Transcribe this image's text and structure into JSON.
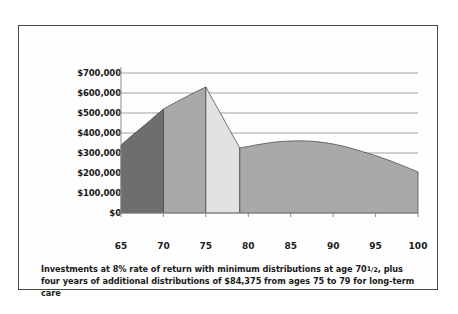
{
  "caption": {
    "line1_a": "Investments at 8% rate of return with minimum distributions at age 70",
    "line1_frac_n": "1",
    "line1_frac_slash": "/",
    "line1_frac_d": "2",
    "line1_b": ", plus four",
    "line2": "years of additional distributions of $84,375 from ages 75 to 79 for long-term care"
  },
  "colors": {
    "band_1": "#6e6e6e",
    "band_2": "#a9a9a9",
    "band_3": "#e2e2e2",
    "band_4": "#a9a9a9",
    "gridline": "#8a8a8a",
    "axis": "#8a8a8a",
    "outline": "#3c3c3c",
    "frame": "#4a4a4a",
    "text": "#1a1a1a",
    "background": "#ffffff"
  },
  "chart_data": {
    "type": "area",
    "title": "",
    "subtitle": "",
    "xlabel": "",
    "ylabel": "",
    "xlim": [
      65,
      100
    ],
    "ylim": [
      0,
      700000
    ],
    "grid": true,
    "legend_position": "none",
    "x_ticks": [
      65,
      70,
      75,
      80,
      85,
      90,
      95,
      100
    ],
    "x_tick_labels": [
      "65",
      "70",
      "75",
      "80",
      "85",
      "90",
      "95",
      "100"
    ],
    "y_ticks": [
      0,
      100000,
      200000,
      300000,
      400000,
      500000,
      600000,
      700000
    ],
    "y_tick_labels": [
      "$0",
      "$100,000",
      "$200,000",
      "$300,000",
      "$400,000",
      "$500,000",
      "$600,000",
      "$700,000"
    ],
    "x": [
      65,
      66,
      67,
      68,
      69,
      70,
      71,
      72,
      73,
      74,
      75,
      76,
      77,
      78,
      79,
      80,
      81,
      82,
      83,
      84,
      85,
      86,
      87,
      88,
      89,
      90,
      91,
      92,
      93,
      94,
      95,
      96,
      97,
      98,
      99,
      100
    ],
    "series": [
      {
        "name": "Account balance",
        "values": [
          340000,
          377000,
          412000,
          447000,
          484000,
          520000,
          543000,
          566000,
          588000,
          610000,
          630000,
          553000,
          477000,
          400000,
          325000,
          333000,
          341000,
          348000,
          354000,
          358000,
          360000,
          361000,
          360000,
          357000,
          352000,
          345000,
          336000,
          325000,
          313000,
          300000,
          287000,
          272000,
          257000,
          240000,
          223000,
          205000
        ]
      }
    ],
    "bands": [
      {
        "name": "age-65-to-70-accumulation",
        "x_start": 65,
        "x_end": 70,
        "fill": "#6e6e6e"
      },
      {
        "name": "age-70-to-75-minimum-distributions",
        "x_start": 70,
        "x_end": 75,
        "fill": "#a9a9a9"
      },
      {
        "name": "age-75-to-79-long-term-care-distributions",
        "x_start": 75,
        "x_end": 79,
        "fill": "#e2e2e2"
      },
      {
        "name": "age-79-to-100-remaining-balance",
        "x_start": 79,
        "x_end": 100,
        "fill": "#a9a9a9"
      }
    ],
    "annotations": [
      {
        "name": "peak",
        "x": 75,
        "y": 630000
      },
      {
        "name": "post-care-trough",
        "x": 79,
        "y": 325000
      },
      {
        "name": "start",
        "x": 65,
        "y": 340000
      },
      {
        "name": "end",
        "x": 100,
        "y": 205000
      }
    ]
  }
}
